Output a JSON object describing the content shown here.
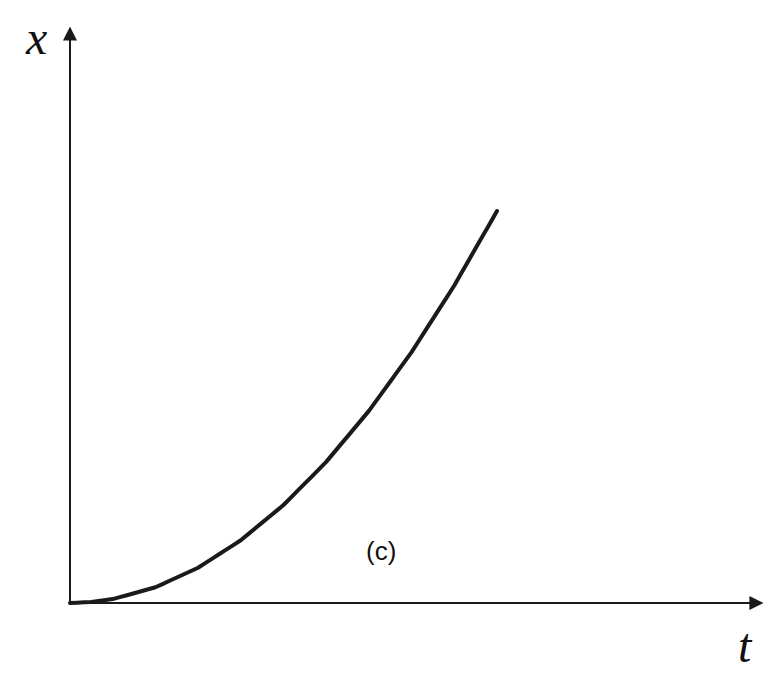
{
  "chart_data": {
    "type": "line",
    "title": "",
    "xlabel": "t",
    "ylabel": "x",
    "annotation": "(c)",
    "grid": false,
    "legend": null,
    "ticks": {
      "x": [],
      "y": []
    },
    "series": [
      {
        "name": "x(t)",
        "color": "#1a1a1a",
        "x": [
          0,
          0.05,
          0.1,
          0.2,
          0.3,
          0.4,
          0.5,
          0.6,
          0.7,
          0.8,
          0.9,
          1.0
        ],
        "y": [
          0,
          0.0025,
          0.01,
          0.04,
          0.09,
          0.16,
          0.25,
          0.36,
          0.49,
          0.64,
          0.81,
          1.0
        ]
      }
    ],
    "xlim": [
      0,
      1.6
    ],
    "ylim": [
      0,
      1.45
    ]
  },
  "labels": {
    "y_axis": "x",
    "x_axis": "t",
    "panel": "(c)"
  },
  "colors": {
    "axis": "#1a1a1a",
    "curve": "#1a1a1a",
    "background": "#ffffff"
  }
}
